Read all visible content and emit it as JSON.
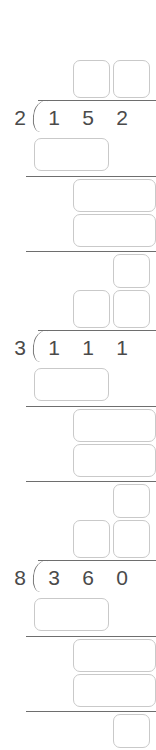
{
  "worksheet": {
    "title": "Long Division Practice",
    "problem_count": 3,
    "colors": {
      "box_border": "#c9c9c9",
      "rule": "#6e6e6e",
      "digit_text": "#4a4a4a",
      "background": "#ffffff"
    },
    "problems": [
      {
        "id": "problem-1",
        "divisor": "2",
        "dividend_digits": [
          "1",
          "5",
          "2"
        ],
        "dividend": "152",
        "quotient_boxes": [
          "",
          ""
        ],
        "work_box_1": "",
        "work_box_2": "",
        "work_box_3": "",
        "remainder_box": ""
      },
      {
        "id": "problem-2",
        "divisor": "3",
        "dividend_digits": [
          "1",
          "1",
          "1"
        ],
        "dividend": "111",
        "quotient_boxes": [
          "",
          ""
        ],
        "work_box_1": "",
        "work_box_2": "",
        "work_box_3": "",
        "remainder_box": ""
      },
      {
        "id": "problem-3",
        "divisor": "8",
        "dividend_digits": [
          "3",
          "6",
          "0"
        ],
        "dividend": "360",
        "quotient_boxes": [
          "",
          ""
        ],
        "work_box_1": "",
        "work_box_2": "",
        "work_box_3": "",
        "remainder_box": ""
      }
    ]
  }
}
